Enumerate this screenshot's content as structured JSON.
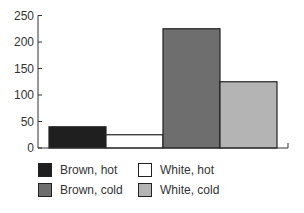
{
  "chart_data": {
    "type": "bar",
    "title": "",
    "xlabel": "",
    "ylabel": "",
    "categories": [
      "Brown, hot",
      "White, hot",
      "Brown, cold",
      "White, cold"
    ],
    "values": [
      40,
      25,
      225,
      125
    ],
    "colors": [
      "#1f1f1f",
      "#ffffff",
      "#6e6e6e",
      "#b4b4b4"
    ],
    "ylim": [
      0,
      250
    ],
    "yticks": [
      0,
      50,
      100,
      150,
      200,
      250
    ],
    "grid": false,
    "legend_position": "bottom"
  },
  "legend": {
    "items": [
      {
        "label": "Brown, hot",
        "color": "#1f1f1f"
      },
      {
        "label": "White, hot",
        "color": "#ffffff"
      },
      {
        "label": "Brown, cold",
        "color": "#6e6e6e"
      },
      {
        "label": "White, cold",
        "color": "#b4b4b4"
      }
    ]
  }
}
